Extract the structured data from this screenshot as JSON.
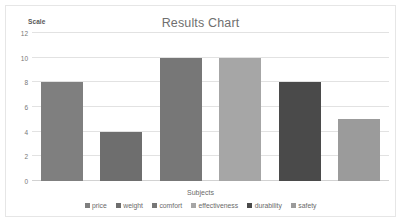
{
  "chart_data": {
    "type": "bar",
    "title": "Results Chart",
    "xlabel": "Subjects",
    "ylabel": "Scale",
    "categories": [
      "price",
      "weight",
      "comfort",
      "effectiveness",
      "durability",
      "safety"
    ],
    "values": [
      8,
      4,
      10,
      10,
      8,
      5
    ],
    "series": [
      {
        "name": "Results",
        "values": [
          8,
          4,
          10,
          10,
          8,
          5
        ]
      }
    ],
    "ylim": [
      0,
      12
    ],
    "ytick_labels": [
      "12",
      "10",
      "8",
      "6",
      "4",
      "2",
      "0"
    ],
    "ytick_values": [
      12,
      10,
      8,
      6,
      4,
      2,
      0
    ],
    "grid": true,
    "legend_position": "bottom",
    "colors": [
      "#7f7f7f",
      "#6e6e6e",
      "#777777",
      "#a6a6a6",
      "#4a4a4a",
      "#9b9b9b"
    ],
    "legend": [
      {
        "label": "price",
        "color": "#7f7f7f"
      },
      {
        "label": "weight",
        "color": "#6e6e6e"
      },
      {
        "label": "comfort",
        "color": "#777777"
      },
      {
        "label": "effectiveness",
        "color": "#a6a6a6"
      },
      {
        "label": "durability",
        "color": "#4a4a4a"
      },
      {
        "label": "safety",
        "color": "#9b9b9b"
      }
    ],
    "title_color": "#6f6f6f",
    "grid_color": "#e2e2e2",
    "background": "#ffffff",
    "border_color": "#e6e6e6"
  }
}
